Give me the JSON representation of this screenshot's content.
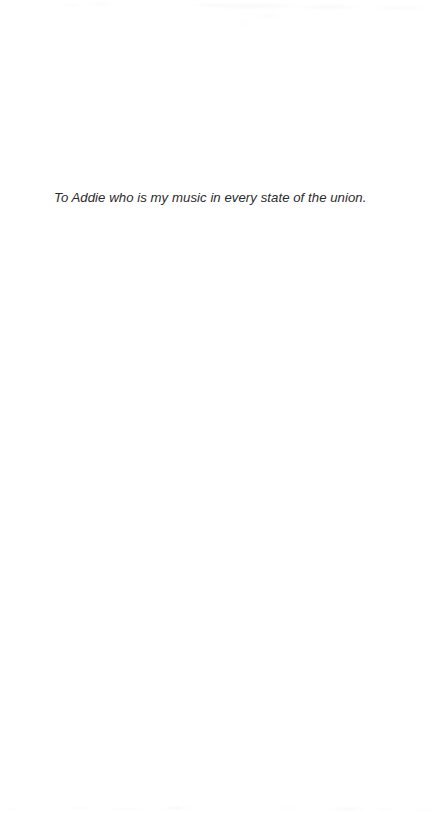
{
  "page": {
    "kind": "scanned-book-dedication-page",
    "background_color": "#ffffff",
    "width": 440,
    "height": 813
  },
  "dedication": {
    "text": "To Addie who is my music in every state of the union.",
    "style": "italic",
    "text_color": "#2b2b2d"
  },
  "artifacts": {
    "top_ghost_label": "",
    "bottom_ghost_label": ""
  }
}
